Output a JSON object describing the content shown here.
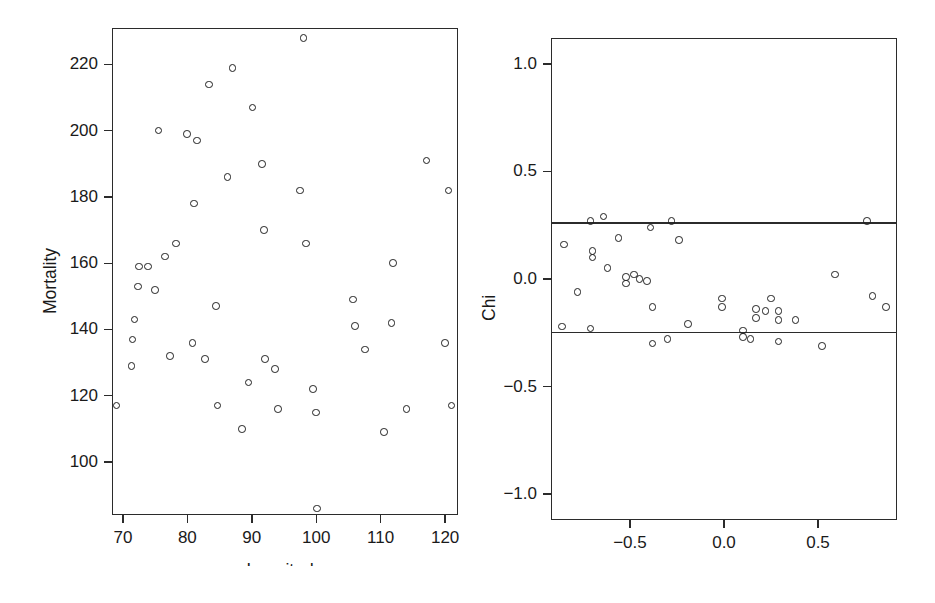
{
  "figure": {
    "background": "#ffffff",
    "ink_color": "#1f1f1f"
  },
  "chart_data": [
    {
      "panel": "left",
      "type": "scatter",
      "title": "",
      "xlabel": "Longitude",
      "ylabel": "Mortality",
      "xlim": [
        68.3,
        122.0
      ],
      "ylim": [
        84.0,
        231.0
      ],
      "xticks": [
        70,
        80,
        90,
        100,
        110,
        120
      ],
      "xticklabels": [
        "70",
        "80",
        "90",
        "100",
        "110",
        "120"
      ],
      "yticks": [
        100,
        120,
        140,
        160,
        180,
        200,
        220
      ],
      "yticklabels": [
        "100",
        "120",
        "140",
        "160",
        "180",
        "200",
        "220"
      ],
      "grid": false,
      "legend": null,
      "marker": "open-circle",
      "points": [
        {
          "x": 69.0,
          "y": 117
        },
        {
          "x": 71.3,
          "y": 129
        },
        {
          "x": 71.5,
          "y": 137
        },
        {
          "x": 71.8,
          "y": 143
        },
        {
          "x": 72.3,
          "y": 153
        },
        {
          "x": 72.5,
          "y": 159
        },
        {
          "x": 73.9,
          "y": 159
        },
        {
          "x": 75.0,
          "y": 152
        },
        {
          "x": 75.5,
          "y": 200
        },
        {
          "x": 76.5,
          "y": 162
        },
        {
          "x": 77.3,
          "y": 132
        },
        {
          "x": 78.2,
          "y": 166
        },
        {
          "x": 79.9,
          "y": 199
        },
        {
          "x": 80.8,
          "y": 136
        },
        {
          "x": 81.0,
          "y": 178
        },
        {
          "x": 81.5,
          "y": 197
        },
        {
          "x": 82.7,
          "y": 131
        },
        {
          "x": 83.4,
          "y": 214
        },
        {
          "x": 84.4,
          "y": 147
        },
        {
          "x": 84.7,
          "y": 117
        },
        {
          "x": 86.2,
          "y": 186
        },
        {
          "x": 87.0,
          "y": 219
        },
        {
          "x": 88.5,
          "y": 110
        },
        {
          "x": 89.5,
          "y": 124
        },
        {
          "x": 90.1,
          "y": 207
        },
        {
          "x": 91.6,
          "y": 190
        },
        {
          "x": 91.9,
          "y": 170
        },
        {
          "x": 92.0,
          "y": 131
        },
        {
          "x": 93.6,
          "y": 128
        },
        {
          "x": 94.1,
          "y": 116
        },
        {
          "x": 97.5,
          "y": 182
        },
        {
          "x": 98.0,
          "y": 228
        },
        {
          "x": 98.4,
          "y": 166
        },
        {
          "x": 99.5,
          "y": 122
        },
        {
          "x": 100.0,
          "y": 115
        },
        {
          "x": 100.1,
          "y": 86
        },
        {
          "x": 105.7,
          "y": 149
        },
        {
          "x": 106.0,
          "y": 141
        },
        {
          "x": 107.6,
          "y": 134
        },
        {
          "x": 110.5,
          "y": 109
        },
        {
          "x": 111.7,
          "y": 142
        },
        {
          "x": 111.9,
          "y": 160
        },
        {
          "x": 114.0,
          "y": 116
        },
        {
          "x": 117.1,
          "y": 191
        },
        {
          "x": 120.0,
          "y": 136
        },
        {
          "x": 120.5,
          "y": 182
        },
        {
          "x": 121.0,
          "y": 117
        }
      ]
    },
    {
      "panel": "right",
      "type": "scatter",
      "title": "",
      "xlabel": "lambda",
      "ylabel": "Chi",
      "xlim": [
        -0.92,
        0.92
      ],
      "ylim": [
        -1.12,
        1.12
      ],
      "xticks": [
        -0.5,
        0.0,
        0.5
      ],
      "xticklabels": [
        "−0.5",
        "0.0",
        "0.5"
      ],
      "yticks": [
        -1.0,
        -0.5,
        0.0,
        0.5,
        1.0
      ],
      "yticklabels": [
        "−1.0",
        "−0.5",
        "0.0",
        "0.5",
        "1.0"
      ],
      "grid": false,
      "legend": null,
      "marker": "open-circle",
      "reference_lines": [
        {
          "orientation": "horizontal",
          "y": 0.26
        },
        {
          "orientation": "horizontal",
          "y": -0.25
        }
      ],
      "points": [
        {
          "x": -0.85,
          "y": 0.16
        },
        {
          "x": -0.86,
          "y": -0.22
        },
        {
          "x": -0.78,
          "y": -0.06
        },
        {
          "x": -0.71,
          "y": 0.27
        },
        {
          "x": -0.7,
          "y": 0.1
        },
        {
          "x": -0.7,
          "y": 0.13
        },
        {
          "x": -0.71,
          "y": -0.23
        },
        {
          "x": -0.64,
          "y": 0.29
        },
        {
          "x": -0.62,
          "y": 0.05
        },
        {
          "x": -0.56,
          "y": 0.19
        },
        {
          "x": -0.52,
          "y": -0.02
        },
        {
          "x": -0.52,
          "y": 0.01
        },
        {
          "x": -0.48,
          "y": 0.02
        },
        {
          "x": -0.45,
          "y": 0.0
        },
        {
          "x": -0.41,
          "y": -0.01
        },
        {
          "x": -0.39,
          "y": 0.24
        },
        {
          "x": -0.38,
          "y": -0.13
        },
        {
          "x": -0.38,
          "y": -0.3
        },
        {
          "x": -0.3,
          "y": -0.28
        },
        {
          "x": -0.28,
          "y": 0.27
        },
        {
          "x": -0.24,
          "y": 0.18
        },
        {
          "x": -0.19,
          "y": -0.21
        },
        {
          "x": -0.01,
          "y": -0.09
        },
        {
          "x": -0.01,
          "y": -0.13
        },
        {
          "x": 0.1,
          "y": -0.24
        },
        {
          "x": 0.1,
          "y": -0.27
        },
        {
          "x": 0.14,
          "y": -0.28
        },
        {
          "x": 0.17,
          "y": -0.14
        },
        {
          "x": 0.17,
          "y": -0.18
        },
        {
          "x": 0.22,
          "y": -0.15
        },
        {
          "x": 0.25,
          "y": -0.09
        },
        {
          "x": 0.29,
          "y": -0.15
        },
        {
          "x": 0.29,
          "y": -0.19
        },
        {
          "x": 0.29,
          "y": -0.29
        },
        {
          "x": 0.38,
          "y": -0.19
        },
        {
          "x": 0.52,
          "y": -0.31
        },
        {
          "x": 0.59,
          "y": 0.02
        },
        {
          "x": 0.76,
          "y": 0.27
        },
        {
          "x": 0.79,
          "y": -0.08
        },
        {
          "x": 0.86,
          "y": -0.13
        }
      ]
    }
  ]
}
